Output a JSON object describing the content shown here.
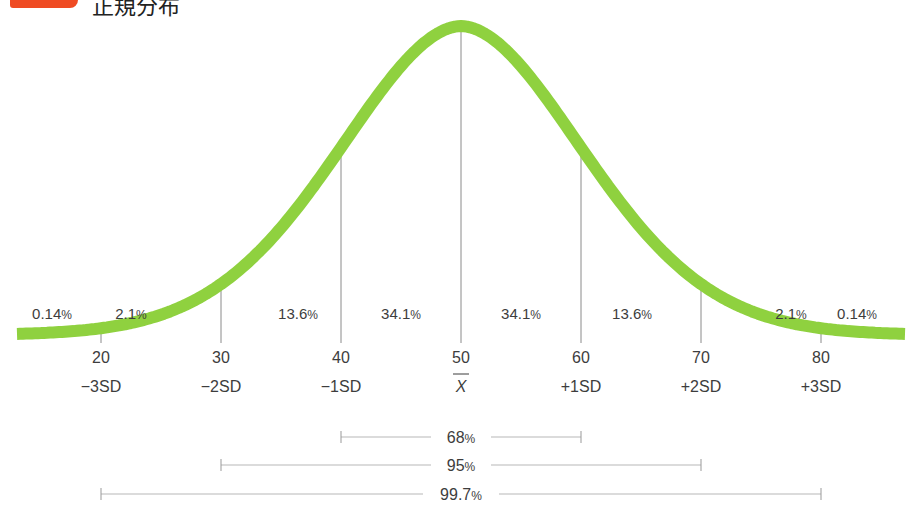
{
  "header": {
    "title": "正規分布"
  },
  "chart_data": {
    "type": "line",
    "title": "正規分布",
    "subtitle": "Normal distribution",
    "x_ticks": [
      20,
      30,
      40,
      50,
      60,
      70,
      80
    ],
    "x_tick_labels": [
      "20",
      "30",
      "40",
      "50",
      "60",
      "70",
      "80"
    ],
    "sd_labels": [
      "−3SD",
      "−2SD",
      "−1SD",
      "X",
      "+1SD",
      "+2SD",
      "+3SD"
    ],
    "mean": 50,
    "sd": 10,
    "xlim": [
      13,
      87
    ],
    "curve_color": "#8fd13f",
    "region_percentages": [
      {
        "range": "<20",
        "label": "0.14%"
      },
      {
        "range": "20-30",
        "label": "2.1%"
      },
      {
        "range": "30-40",
        "label": "13.6%"
      },
      {
        "range": "40-50",
        "label": "34.1%"
      },
      {
        "range": "50-60",
        "label": "34.1%"
      },
      {
        "range": "60-70",
        "label": "13.6%"
      },
      {
        "range": "70-80",
        "label": "2.1%"
      },
      {
        "range": ">80",
        "label": "0.14%"
      }
    ],
    "intervals": [
      {
        "from": 40,
        "to": 60,
        "label": "68%"
      },
      {
        "from": 30,
        "to": 70,
        "label": "95%"
      },
      {
        "from": 20,
        "to": 80,
        "label": "99.7%"
      }
    ],
    "grid": false,
    "legend": "none"
  }
}
